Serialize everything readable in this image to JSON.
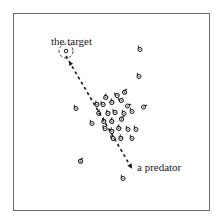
{
  "figure": {
    "labels": {
      "target": "the target",
      "predator": "a predator"
    },
    "colors": {
      "ink": "#1a1a1a",
      "frame": "#6a6a6a",
      "background": "#ffffff"
    },
    "target": {
      "x": 66,
      "y": 51
    },
    "predator": {
      "x": 131,
      "y": 167
    },
    "path": [
      [
        66,
        56
      ],
      [
        131,
        167
      ]
    ],
    "agents": [
      {
        "x": 140,
        "y": 49,
        "dir": 0
      },
      {
        "x": 139,
        "y": 76,
        "dir": 0
      },
      {
        "x": 106,
        "y": 97,
        "dir": 30
      },
      {
        "x": 117,
        "y": 95,
        "dir": -20
      },
      {
        "x": 125,
        "y": 92,
        "dir": 60
      },
      {
        "x": 76,
        "y": 108,
        "dir": 0
      },
      {
        "x": 97,
        "y": 104,
        "dir": 10
      },
      {
        "x": 103,
        "y": 104,
        "dir": -10
      },
      {
        "x": 112,
        "y": 102,
        "dir": 20
      },
      {
        "x": 121,
        "y": 100,
        "dir": -30
      },
      {
        "x": 128,
        "y": 106,
        "dir": 90
      },
      {
        "x": 144,
        "y": 107,
        "dir": 90
      },
      {
        "x": 99,
        "y": 113,
        "dir": 40
      },
      {
        "x": 108,
        "y": 113,
        "dir": 10
      },
      {
        "x": 115,
        "y": 112,
        "dir": -10
      },
      {
        "x": 124,
        "y": 113,
        "dir": 0
      },
      {
        "x": 132,
        "y": 111,
        "dir": 0
      },
      {
        "x": 92,
        "y": 123,
        "dir": 0
      },
      {
        "x": 104,
        "y": 121,
        "dir": 20
      },
      {
        "x": 112,
        "y": 121,
        "dir": 30
      },
      {
        "x": 122,
        "y": 119,
        "dir": 70
      },
      {
        "x": 105,
        "y": 128,
        "dir": -10
      },
      {
        "x": 112,
        "y": 131,
        "dir": 20
      },
      {
        "x": 119,
        "y": 128,
        "dir": 30
      },
      {
        "x": 128,
        "y": 129,
        "dir": 0
      },
      {
        "x": 136,
        "y": 129,
        "dir": 0
      },
      {
        "x": 132,
        "y": 138,
        "dir": 0
      },
      {
        "x": 121,
        "y": 138,
        "dir": 20
      },
      {
        "x": 113,
        "y": 138,
        "dir": -20
      },
      {
        "x": 81,
        "y": 161,
        "dir": 60
      },
      {
        "x": 123,
        "y": 178,
        "dir": 0
      }
    ]
  }
}
